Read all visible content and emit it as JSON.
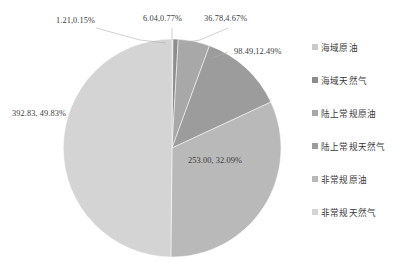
{
  "chart_data": {
    "type": "pie",
    "title": "",
    "subtitle": "",
    "xlabel": "",
    "ylabel": "",
    "legend_position": "right",
    "grid": false,
    "total": 788.35,
    "categories": [
      "海域原油",
      "海域天然气",
      "陆上常规原油",
      "陆上常规天然气",
      "非常规原油",
      "非常规天然气"
    ],
    "values": [
      1.21,
      6.04,
      36.78,
      98.49,
      253.0,
      392.83
    ],
    "percents": [
      "0.15%",
      "0.77%",
      "4.67%",
      "12.49%",
      "32.09%",
      "49.83%"
    ],
    "colors": [
      "#c9c9c9",
      "#8d8d8d",
      "#a8a8a8",
      "#9c9c9c",
      "#b9b9b9",
      "#d4d4d4"
    ],
    "labels": [
      "1.21,0.15%",
      "6.04,0.77%",
      "36.78,4.67%",
      "98.49,12.49%",
      "253.00, 32.09%",
      "392.83, 49.83%"
    ],
    "slices": [
      {
        "name": "海域原油",
        "value": 1.21,
        "percent": "0.15%",
        "label": "1.21,0.15%",
        "color": "#c9c9c9"
      },
      {
        "name": "海域天然气",
        "value": 6.04,
        "percent": "0.77%",
        "label": "6.04,0.77%",
        "color": "#8d8d8d"
      },
      {
        "name": "陆上常规原油",
        "value": 36.78,
        "percent": "4.67%",
        "label": "36.78,4.67%",
        "color": "#a8a8a8"
      },
      {
        "name": "陆上常规天然气",
        "value": 98.49,
        "percent": "12.49%",
        "label": "98.49,12.49%",
        "color": "#9c9c9c"
      },
      {
        "name": "非常规原油",
        "value": 253.0,
        "percent": "32.09%",
        "label": "253.00, 32.09%",
        "color": "#b9b9b9"
      },
      {
        "name": "非常规天然气",
        "value": 392.83,
        "percent": "49.83%",
        "label": "392.83, 49.83%",
        "color": "#d4d4d4"
      }
    ]
  },
  "legend": {
    "items": [
      {
        "label": "海域原油",
        "color": "#c9c9c9"
      },
      {
        "label": "海域天然气",
        "color": "#8d8d8d"
      },
      {
        "label": "陆上常规原油",
        "color": "#a8a8a8"
      },
      {
        "label": "陆上常规天然气",
        "color": "#9c9c9c"
      },
      {
        "label": "非常规原油",
        "color": "#b9b9b9"
      },
      {
        "label": "非常规天然气",
        "color": "#d4d4d4"
      }
    ]
  },
  "callouts": {
    "left_top": "1.21,0.15%",
    "mid_top": "6.04,0.77%",
    "right_top": "36.78,4.67%",
    "right": "98.49,12.49%",
    "inner": "253.00, 32.09%",
    "left": "392.83, 49.83%"
  }
}
